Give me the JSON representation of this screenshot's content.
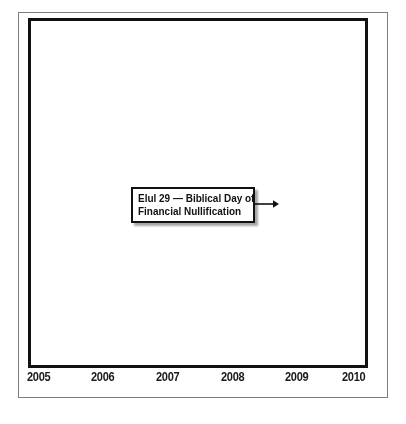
{
  "figure": {
    "title": "",
    "background_color": "#ffffff",
    "frame_color": "#111111",
    "outer_frame_color": "#7d7d7d"
  },
  "annotation": {
    "line1": "Elul 29 — Biblical Day of",
    "line2": "Financial Nullification",
    "arrow_icon": "arrow-right-icon",
    "points_to_year": 2008.6
  },
  "chart_data": {
    "type": "area",
    "title": "",
    "xlabel": "",
    "ylabel": "",
    "grid": false,
    "legend": false,
    "fill_color": "#c8c8c8",
    "line_color": "#111111",
    "xlim": [
      2004.82,
      2010.08
    ],
    "ylim": [
      0,
      100
    ],
    "xticks": [
      2005,
      2006,
      2007,
      2008,
      2009,
      2010
    ],
    "xtick_labels": [
      "2005",
      "2006",
      "2007",
      "2008",
      "2009",
      "2010"
    ],
    "marker_lines": [
      {
        "x": 2008.63,
        "label": "Elul 29 — Biblical Day of Financial Nullification",
        "color": "#111111"
      }
    ],
    "x": [
      2004.85,
      2004.97,
      2005.06,
      2005.15,
      2005.24,
      2005.33,
      2005.42,
      2005.51,
      2005.6,
      2005.69,
      2005.78,
      2005.87,
      2005.96,
      2006.05,
      2006.14,
      2006.23,
      2006.32,
      2006.41,
      2006.5,
      2006.59,
      2006.68,
      2006.77,
      2006.86,
      2006.95,
      2007.04,
      2007.13,
      2007.22,
      2007.31,
      2007.4,
      2007.49,
      2007.58,
      2007.67,
      2007.76,
      2007.85,
      2007.94,
      2008.03,
      2008.12,
      2008.21,
      2008.3,
      2008.39,
      2008.48,
      2008.57,
      2008.63,
      2008.72,
      2008.81,
      2008.9,
      2008.99,
      2009.08,
      2009.17,
      2009.26,
      2009.35,
      2009.44,
      2009.53,
      2009.62,
      2009.71,
      2009.8,
      2009.89,
      2009.98
    ],
    "values": [
      57,
      42,
      65,
      61,
      52,
      57,
      55,
      50,
      53,
      58,
      67,
      71,
      66,
      72,
      70,
      63,
      72,
      74,
      76,
      73,
      79,
      82,
      86,
      88,
      83,
      89,
      92,
      81,
      85,
      78,
      98,
      83,
      87,
      75,
      88,
      80,
      71,
      76,
      82,
      69,
      74,
      66,
      62,
      50,
      42,
      44,
      30,
      38,
      19,
      26,
      5,
      24,
      33,
      30,
      46,
      52,
      45,
      58
    ]
  }
}
